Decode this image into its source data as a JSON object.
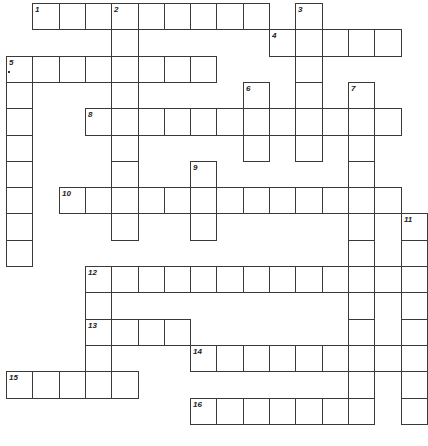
{
  "puzzle": {
    "type": "crossword",
    "cell_size": 26.3,
    "origin": {
      "x": 6,
      "y": 3
    },
    "colors": {
      "line": "#3a3a3a",
      "cell": "#ffffff",
      "number": "#222222"
    },
    "entries": [
      {
        "num": "1",
        "dir": "across",
        "row": 0,
        "col": 1,
        "len": 9
      },
      {
        "num": "2",
        "dir": "down",
        "row": 0,
        "col": 4,
        "len": 9
      },
      {
        "num": "3",
        "dir": "down",
        "row": 0,
        "col": 11,
        "len": 6
      },
      {
        "num": "4",
        "dir": "across",
        "row": 1,
        "col": 10,
        "len": 5
      },
      {
        "num": "5",
        "dir": "across",
        "row": 2,
        "col": 0,
        "len": 8
      },
      {
        "num": "5",
        "dir": "down",
        "row": 2,
        "col": 0,
        "len": 8
      },
      {
        "num": "6",
        "dir": "down",
        "row": 3,
        "col": 9,
        "len": 3
      },
      {
        "num": "7",
        "dir": "down",
        "row": 3,
        "col": 13,
        "len": 13
      },
      {
        "num": "8",
        "dir": "across",
        "row": 4,
        "col": 3,
        "len": 12
      },
      {
        "num": "9",
        "dir": "down",
        "row": 6,
        "col": 7,
        "len": 3
      },
      {
        "num": "10",
        "dir": "across",
        "row": 7,
        "col": 2,
        "len": 13
      },
      {
        "num": "11",
        "dir": "down",
        "row": 8,
        "col": 15,
        "len": 8
      },
      {
        "num": "12",
        "dir": "across",
        "row": 10,
        "col": 3,
        "len": 13
      },
      {
        "num": "12",
        "dir": "down",
        "row": 10,
        "col": 3,
        "len": 4
      },
      {
        "num": "13",
        "dir": "across",
        "row": 12,
        "col": 3,
        "len": 4
      },
      {
        "num": "14",
        "dir": "across",
        "row": 13,
        "col": 7,
        "len": 9
      },
      {
        "num": "15",
        "dir": "across",
        "row": 14,
        "col": 0,
        "len": 5
      },
      {
        "num": "16",
        "dir": "across",
        "row": 15,
        "col": 7,
        "len": 7
      }
    ]
  }
}
